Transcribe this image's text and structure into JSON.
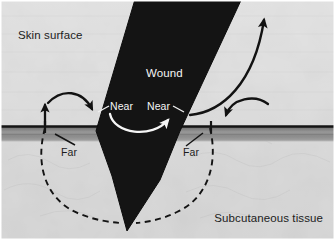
{
  "figure": {
    "kind": "surgical-diagram",
    "width": 335,
    "height": 240
  },
  "labels": {
    "skin_surface": "Skin surface",
    "wound": "Wound",
    "near_left": "Near",
    "near_right": "Near",
    "far_left": "Far",
    "far_right": "Far",
    "subcutaneous_tissue": "Subcutaneous tissue"
  },
  "colors": {
    "wound_fill": "#151515",
    "epidermis_line": "#1a1a1a",
    "dermis_band": "#8e8e8e",
    "upper_tissue": "#e6e6e6",
    "lower_tissue": "#d5d5d5",
    "arrow_dark": "#121212",
    "arrow_light": "#f5f5f5",
    "dashed_path": "#151515",
    "label_dark": "#1c1c1c",
    "label_light": "#f4f4f4",
    "frame_border": "#ffffff"
  },
  "elements": {
    "wound_wedge": "wound-wedge",
    "skin_band": "skin-band",
    "near_arrow": "near-suture-arrow",
    "far_arrow_left": "far-suture-arrow-left",
    "far_arrow_right": "far-suture-arrow-right",
    "dashed_left": "dashed-suture-path-left",
    "dashed_right": "dashed-suture-path-right",
    "tension_arrow": "tension-release-arrow"
  }
}
